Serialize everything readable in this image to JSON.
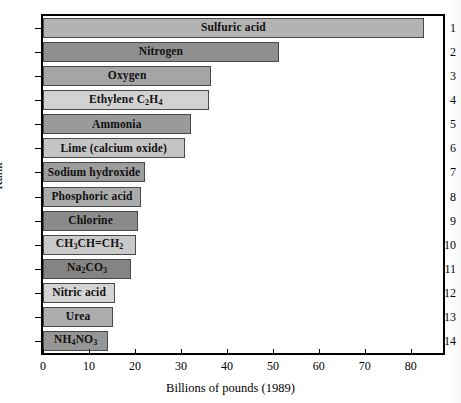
{
  "chart_data": {
    "type": "bar",
    "orientation": "horizontal",
    "title": "",
    "xlabel": "Billions of pounds (1989)",
    "ylabel": "Rank",
    "xlim": [
      0,
      87
    ],
    "ylim_ranks": [
      1,
      14
    ],
    "grid": false,
    "legend": "none",
    "xticks": [
      0,
      10,
      20,
      30,
      40,
      50,
      60,
      70,
      80
    ],
    "xtick_labels": [
      "0",
      "10",
      "20",
      "30",
      "40",
      "50",
      "60",
      "70",
      "80"
    ],
    "ytick_labels": [
      "1",
      "2",
      "3",
      "4",
      "5",
      "6",
      "7",
      "8",
      "9",
      "10",
      "11",
      "12",
      "13",
      "14"
    ],
    "categories": [
      "Sulfuric acid",
      "Nitrogen",
      "Oxygen",
      "Ethylene C2H4",
      "Ammonia",
      "Lime (calcium oxide)",
      "Sodium hydroxide",
      "Phosphoric acid",
      "Chlorine",
      "CH3CH=CH2",
      "Na2CO3",
      "Nitric acid",
      "Urea",
      "NH4NO3"
    ],
    "values": [
      82.8,
      51.3,
      36.6,
      36.0,
      32.1,
      30.8,
      22.2,
      21.3,
      20.7,
      20.3,
      19.2,
      15.7,
      15.3,
      14.2
    ],
    "bars": [
      {
        "rank": "1",
        "label_html": "Sulfuric acid",
        "value": 82.8,
        "color": "#b3b3b3"
      },
      {
        "rank": "2",
        "label_html": "Nitrogen",
        "value": 51.3,
        "color": "#8f8f8f"
      },
      {
        "rank": "3",
        "label_html": "Oxygen",
        "value": 36.6,
        "color": "#a5a5a5"
      },
      {
        "rank": "4",
        "label_html": "Ethylene C<sub>2</sub>H<sub>4</sub>",
        "value": 36.0,
        "color": "#d2d2d2"
      },
      {
        "rank": "5",
        "label_html": "Ammonia",
        "value": 32.1,
        "color": "#9a9a9a"
      },
      {
        "rank": "6",
        "label_html": "Lime (calcium oxide)",
        "value": 30.8,
        "color": "#c4c4c4"
      },
      {
        "rank": "7",
        "label_html": "Sodium hydroxide",
        "value": 22.2,
        "color": "#9d9d9d"
      },
      {
        "rank": "8",
        "label_html": "Phosphoric acid",
        "value": 21.3,
        "color": "#ababab"
      },
      {
        "rank": "9",
        "label_html": "Chlorine",
        "value": 20.7,
        "color": "#8b8b8b"
      },
      {
        "rank": "10",
        "label_html": "CH<sub>3</sub>CH=CH<sub>2</sub>",
        "value": 20.3,
        "color": "#c9c9c9"
      },
      {
        "rank": "11",
        "label_html": "Na<sub>2</sub>CO<sub>3</sub>",
        "value": 19.2,
        "color": "#848484"
      },
      {
        "rank": "12",
        "label_html": "Nitric acid",
        "value": 15.7,
        "color": "#d4d4d4"
      },
      {
        "rank": "13",
        "label_html": "Urea",
        "value": 15.3,
        "color": "#adadad"
      },
      {
        "rank": "14",
        "label_html": "NH<sub>4</sub>NO<sub>3</sub>",
        "value": 14.2,
        "color": "#969696"
      }
    ],
    "colors": {
      "bar_border": "#4a4a4a",
      "axis": "#000000",
      "background": "#ffffff",
      "text": "#111111"
    }
  }
}
